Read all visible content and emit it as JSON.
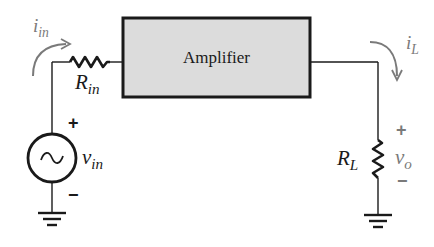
{
  "diagram": {
    "amplifier": {
      "label": "Amplifier",
      "fill": "#dcdcdc"
    },
    "input_current": {
      "symbol": "i",
      "subscript": "in"
    },
    "input_resistor": {
      "symbol": "R",
      "subscript": "in"
    },
    "source": {
      "symbol": "v",
      "subscript": "in",
      "plus": "+",
      "minus": "−",
      "glyph": "~"
    },
    "load_current": {
      "symbol": "i",
      "subscript": "L"
    },
    "load_resistor": {
      "symbol": "R",
      "subscript": "L"
    },
    "output_voltage": {
      "symbol": "v",
      "subscript": "o",
      "plus": "+",
      "minus": "−"
    },
    "colors": {
      "wire": "#1a1a1a",
      "annotation": "#7a7a7a",
      "box_fill": "#dcdcdc"
    }
  }
}
